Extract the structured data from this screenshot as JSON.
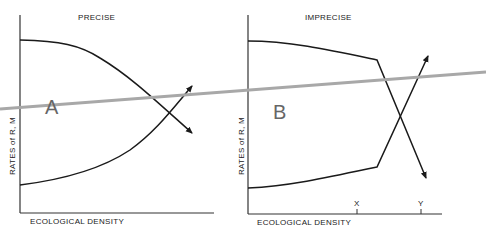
{
  "panels": [
    {
      "title": "PRECISE",
      "letter": "A",
      "xlabel": "ECOLOGICAL DENSITY",
      "ylabel": "RATES of R, M"
    },
    {
      "title": "IMPRECISE",
      "letter": "B",
      "xlabel": "ECOLOGICAL DENSITY",
      "ylabel": "RATES of R, M",
      "ticks": [
        "X",
        "Y"
      ]
    }
  ],
  "colors": {
    "curve": "#1a1a1a",
    "overlay_line": "#a8a8a8"
  }
}
